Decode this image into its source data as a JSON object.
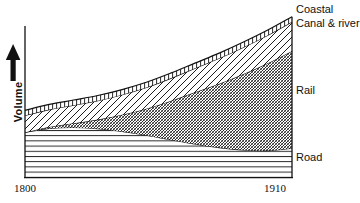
{
  "chart_data": {
    "type": "area",
    "title": "",
    "subtitle": "",
    "xlabel": "",
    "ylabel": "Volume",
    "stacked": true,
    "grid": false,
    "legend_position": "right-inline",
    "x": [
      1800,
      1810,
      1820,
      1830,
      1840,
      1850,
      1860,
      1870,
      1880,
      1890,
      1900,
      1910
    ],
    "xlim": [
      1800,
      1910
    ],
    "xticks": [
      1800,
      1910
    ],
    "xtick_labels": [
      "1800",
      "1910"
    ],
    "ylim": [
      0,
      100
    ],
    "yticks": [],
    "ytick_labels": [],
    "y_axis_arrow": true,
    "series": [
      {
        "name": "Road",
        "label": "Road",
        "hatch": "horizontal-lines",
        "values": [
          29.5,
          32.0,
          32.6,
          31.8,
          30.0,
          27.5,
          24.6,
          21.8,
          19.4,
          17.8,
          17.4,
          19.0
        ]
      },
      {
        "name": "Rail",
        "label": "Rail",
        "hatch": "fine-diagonal-crosshatch",
        "values": [
          0.0,
          1.0,
          2.8,
          6.0,
          11.0,
          17.5,
          25.5,
          34.0,
          42.0,
          50.0,
          57.5,
          64.0
        ]
      },
      {
        "name": "Canal & river",
        "label": "Canal & river",
        "hatch": "diagonal-lines",
        "values": [
          11.0,
          11.4,
          11.9,
          12.5,
          13.2,
          14.0,
          14.9,
          15.8,
          16.8,
          17.7,
          18.5,
          19.2
        ]
      },
      {
        "name": "Coastal",
        "label": "Coastal",
        "hatch": "vertical-ladder",
        "values": [
          3.4,
          3.4,
          3.4,
          3.4,
          3.4,
          3.4,
          3.4,
          3.4,
          3.4,
          3.4,
          3.4,
          3.4
        ]
      }
    ],
    "totals": [
      43.9,
      47.8,
      50.7,
      53.7,
      57.6,
      62.4,
      68.4,
      75.0,
      81.6,
      88.9,
      96.8,
      105.6
    ]
  },
  "axis": {
    "x_start_label": "1800",
    "x_end_label": "1910",
    "y_title": "Volume"
  },
  "labels": {
    "coastal": "Coastal",
    "canal_river": "Canal & river",
    "rail": "Rail",
    "road": "Road"
  },
  "colors": {
    "ink": "#111111",
    "background": "#ffffff"
  }
}
